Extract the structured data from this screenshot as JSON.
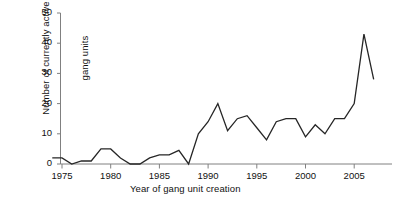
{
  "chart_data": {
    "type": "line",
    "title": "",
    "subtitle": "",
    "xlabel": "Year of gang unit creation",
    "ylabel": "Number of currently active\ngang units",
    "ylabel_line1": "Number of currently active",
    "ylabel_line2": "gang units",
    "xlim": [
      1974,
      2008
    ],
    "ylim": [
      0,
      52
    ],
    "xticks": [
      1975,
      1980,
      1985,
      1990,
      1995,
      2000,
      2005
    ],
    "xtick_labels": [
      "1975",
      "1980",
      "1985",
      "1990",
      "1995",
      "2000",
      "2005"
    ],
    "yticks": [
      0,
      10,
      20,
      30,
      40,
      50
    ],
    "ytick_labels": [
      "0",
      "10",
      "20",
      "30",
      "40",
      "50"
    ],
    "grid": false,
    "legend": "none",
    "line_color": "#262626",
    "line_width": 1.3,
    "axis_color": "#808080",
    "x": [
      1974,
      1975,
      1976,
      1977,
      1978,
      1979,
      1980,
      1981,
      1982,
      1983,
      1984,
      1985,
      1986,
      1987,
      1988,
      1989,
      1990,
      1991,
      1992,
      1993,
      1994,
      1995,
      1996,
      1997,
      1998,
      1999,
      2000,
      2001,
      2002,
      2003,
      2004,
      2005,
      2006,
      2007
    ],
    "values": [
      2,
      2,
      0,
      1,
      1,
      5,
      5,
      2,
      0,
      0,
      2,
      3,
      3,
      4.5,
      0,
      10,
      14,
      20,
      11,
      15,
      16,
      12,
      8,
      14,
      15,
      15,
      9,
      13,
      10,
      15,
      15,
      20,
      43,
      28
    ],
    "series": [
      {
        "name": "Currently active gang units",
        "values": [
          2,
          2,
          0,
          1,
          1,
          5,
          5,
          2,
          0,
          0,
          2,
          3,
          3,
          4.5,
          0,
          10,
          14,
          20,
          11,
          15,
          16,
          12,
          8,
          14,
          15,
          15,
          9,
          13,
          10,
          15,
          15,
          20,
          43,
          28
        ]
      }
    ]
  }
}
